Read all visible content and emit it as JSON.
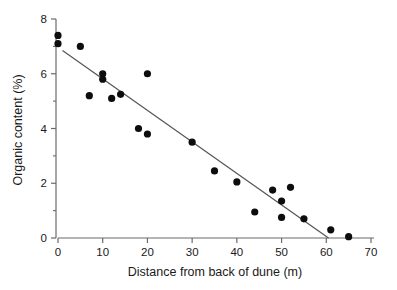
{
  "chart_data": {
    "type": "scatter",
    "title": "",
    "xlabel": "Distance from back of dune (m)",
    "ylabel": "Organic content (%)",
    "xlim": [
      0,
      70
    ],
    "ylim": [
      0,
      8
    ],
    "xticks": [
      0,
      10,
      20,
      30,
      40,
      50,
      60,
      70
    ],
    "yticks": [
      0,
      2,
      4,
      6,
      8
    ],
    "y_minor_ticks": [
      1,
      3,
      5,
      7
    ],
    "grid": false,
    "legend": null,
    "point_color": "#0d0d0d",
    "line_color": "#555555",
    "points": [
      {
        "x": 0,
        "y": 7.4
      },
      {
        "x": 0,
        "y": 7.1
      },
      {
        "x": 5,
        "y": 7.0
      },
      {
        "x": 7,
        "y": 5.2
      },
      {
        "x": 10,
        "y": 6.0
      },
      {
        "x": 10,
        "y": 5.8
      },
      {
        "x": 12,
        "y": 5.1
      },
      {
        "x": 14,
        "y": 5.25
      },
      {
        "x": 18,
        "y": 4.0
      },
      {
        "x": 20,
        "y": 6.0
      },
      {
        "x": 20,
        "y": 3.8
      },
      {
        "x": 30,
        "y": 3.5
      },
      {
        "x": 35,
        "y": 2.45
      },
      {
        "x": 40,
        "y": 2.05
      },
      {
        "x": 44,
        "y": 0.95
      },
      {
        "x": 48,
        "y": 1.75
      },
      {
        "x": 50,
        "y": 1.35
      },
      {
        "x": 50,
        "y": 0.75
      },
      {
        "x": 52,
        "y": 1.85
      },
      {
        "x": 55,
        "y": 0.7
      },
      {
        "x": 61,
        "y": 0.3
      },
      {
        "x": 65,
        "y": 0.05
      }
    ],
    "fit_line": {
      "x_start": 1.0,
      "y_start": 6.85,
      "x_end": 60.5,
      "y_end": 0.0
    }
  }
}
